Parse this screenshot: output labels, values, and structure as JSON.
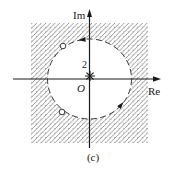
{
  "figure": {
    "caption": "(c)",
    "axes": {
      "imaginary_label": "Im",
      "real_label": "Re",
      "origin_label": "O"
    },
    "pole": {
      "multiplicity_label": "2",
      "marker": "asterisk-icon"
    },
    "circle": {
      "style": "dashed",
      "orientation": "counterclockwise",
      "marked_point_count": 2
    },
    "colors": {
      "background": "#ffffff",
      "axis": "#1a1a1a",
      "hatch": "#8f8f8f",
      "circle_stroke": "#3a3a3a"
    }
  }
}
